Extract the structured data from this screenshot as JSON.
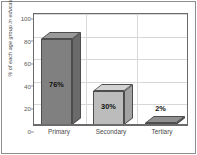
{
  "chart_data": {
    "type": "bar",
    "title": "",
    "subtitle": "",
    "xlabel": "",
    "ylabel": "% of each age group in education",
    "categories": [
      "Primary",
      "Secondary",
      "Tertiary"
    ],
    "values": [
      76,
      30,
      2
    ],
    "data_labels": [
      "76%",
      "30%",
      "2%"
    ],
    "ylim": [
      0,
      100
    ],
    "yticks": [
      0,
      20,
      40,
      60,
      80,
      100
    ],
    "ytick_labels": [
      "0",
      "20",
      "40",
      "60",
      "80",
      "100"
    ],
    "grid": "horizontal-and-vertical",
    "legend": "none",
    "style": "3d-column",
    "series": [
      {
        "name": "% of each age group in education",
        "values": [
          76,
          30,
          2
        ]
      }
    ],
    "bar_colors": [
      "#808080",
      "#bcbcbc",
      "#757575"
    ],
    "bar_top_colors": [
      "#9a9a9a",
      "#d2d2d2",
      "#909090"
    ],
    "bar_side_colors": [
      "#6a6a6a",
      "#a2a2a2",
      "#5e5e5e"
    ],
    "plot_background": "#ffffff",
    "grid_color": "#d8d8d8",
    "axis_color": "#6b6b6b",
    "frame_color": "#8e8e8e"
  }
}
